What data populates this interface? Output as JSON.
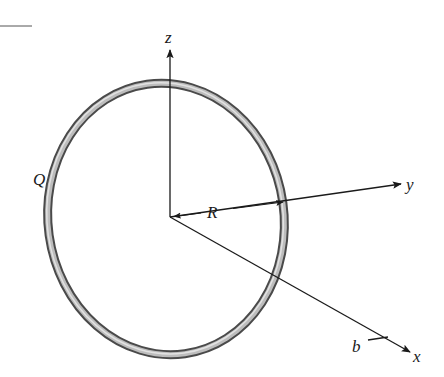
{
  "diagram": {
    "labels": {
      "z_axis": "z",
      "y_axis": "y",
      "x_axis": "x",
      "charge": "Q",
      "radius": "R",
      "point": "b"
    },
    "colors": {
      "ring_outer": "#555555",
      "ring_inner": "#c8c8c8",
      "axis": "#1a1a1a",
      "background": "#ffffff"
    }
  }
}
